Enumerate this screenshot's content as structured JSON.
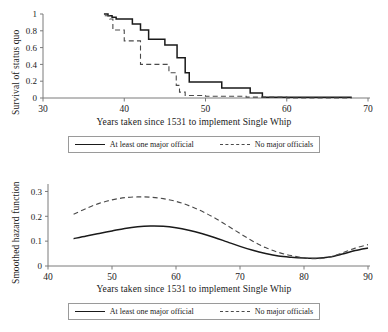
{
  "figure": {
    "panels": [
      {
        "id": "survival",
        "ylabel": "Survival of status quo",
        "xlabel": "Years taken since 1531 to implement Single Whip",
        "legend": {
          "solid_label": "At least one major official",
          "dashed_label": "No major officials"
        }
      },
      {
        "id": "hazard",
        "ylabel": "Smoothed hazard function",
        "xlabel": "Years taken since 1531 to implement Single Whip",
        "legend": {
          "solid_label": "At least one major official",
          "dashed_label": "No major officials"
        }
      }
    ]
  },
  "chart_data": [
    {
      "type": "line",
      "id": "survival-curve",
      "title": "",
      "subtitle": "",
      "xlabel": "Years taken since 1531 to implement Single Whip",
      "ylabel": "Survival of status quo",
      "xlim": [
        30,
        70
      ],
      "ylim": [
        0,
        1
      ],
      "xticks": [
        30,
        40,
        50,
        60,
        70
      ],
      "xticklabels": [
        "30",
        "40",
        "50",
        "60",
        "70"
      ],
      "yticks": [
        0,
        0.2,
        0.4,
        0.6,
        0.8,
        1
      ],
      "yticklabels": [
        "0",
        "0.2",
        "0.4",
        "0.6",
        "0.8",
        "1"
      ],
      "grid": false,
      "step": true,
      "legend_position": "below",
      "series": [
        {
          "name": "At least one major official",
          "style": "solid",
          "color": "#1a1a1a",
          "x": [
            37.5,
            38.0,
            38.5,
            39.0,
            40.0,
            41.0,
            41.5,
            42.0,
            43.0,
            44.5,
            45.0,
            46.0,
            46.5,
            47.0,
            47.5,
            48.0,
            49.0,
            51.0,
            52.0,
            54.0,
            55.5,
            56.0,
            57.0,
            60.0,
            65.0,
            68.0
          ],
          "y": [
            1.0,
            0.98,
            0.96,
            0.94,
            0.94,
            0.88,
            0.88,
            0.81,
            0.7,
            0.7,
            0.63,
            0.63,
            0.48,
            0.48,
            0.3,
            0.19,
            0.19,
            0.19,
            0.12,
            0.12,
            0.06,
            0.06,
            0.01,
            0.01,
            0.01,
            0.01
          ]
        },
        {
          "name": "No major officials",
          "style": "dashed",
          "color": "#4a4a4a",
          "x": [
            37.6,
            38.2,
            38.6,
            39.0,
            40.0,
            41.0,
            41.8,
            42.0,
            43.5,
            45.0,
            45.5,
            46.0,
            46.4,
            46.8,
            47.5,
            50.0,
            55.0,
            60.0,
            65.0,
            68.0
          ],
          "y": [
            0.98,
            0.94,
            0.81,
            0.81,
            0.68,
            0.68,
            0.68,
            0.4,
            0.4,
            0.4,
            0.3,
            0.3,
            0.15,
            0.07,
            0.03,
            0.02,
            0.01,
            0.0,
            0.0,
            0.0
          ]
        }
      ]
    },
    {
      "type": "line",
      "id": "hazard-curve",
      "title": "",
      "subtitle": "",
      "xlabel": "Years taken since 1531 to implement Single Whip",
      "ylabel": "Smoothed hazard function",
      "xlim": [
        40,
        90
      ],
      "ylim": [
        0,
        0.33
      ],
      "xticks": [
        40,
        50,
        60,
        70,
        80,
        90
      ],
      "xticklabels": [
        "40",
        "50",
        "60",
        "70",
        "80",
        "90"
      ],
      "yticks": [
        0,
        0.1,
        0.2,
        0.3
      ],
      "yticklabels": [
        "0",
        "0.1",
        "0.2",
        "0.3"
      ],
      "grid": false,
      "smooth": true,
      "legend_position": "below",
      "series": [
        {
          "name": "At least one major official",
          "style": "solid",
          "color": "#1a1a1a",
          "x": [
            44,
            46,
            48,
            50,
            52,
            54,
            56,
            58,
            60,
            62,
            64,
            66,
            68,
            70,
            72,
            74,
            76,
            78,
            80,
            82,
            84,
            86,
            88,
            90
          ],
          "y": [
            0.11,
            0.121,
            0.131,
            0.141,
            0.151,
            0.158,
            0.161,
            0.16,
            0.154,
            0.144,
            0.131,
            0.115,
            0.097,
            0.079,
            0.063,
            0.05,
            0.04,
            0.035,
            0.032,
            0.031,
            0.036,
            0.048,
            0.062,
            0.072
          ]
        },
        {
          "name": "No major officials",
          "style": "dashed",
          "color": "#4a4a4a",
          "x": [
            44,
            46,
            48,
            50,
            52,
            54,
            56,
            58,
            60,
            62,
            64,
            66,
            68,
            70,
            72,
            74,
            76,
            78,
            80,
            82,
            84,
            86,
            88,
            90
          ],
          "y": [
            0.208,
            0.232,
            0.252,
            0.266,
            0.275,
            0.278,
            0.277,
            0.271,
            0.26,
            0.243,
            0.221,
            0.194,
            0.163,
            0.131,
            0.1,
            0.074,
            0.055,
            0.042,
            0.033,
            0.029,
            0.036,
            0.053,
            0.072,
            0.086
          ]
        }
      ]
    }
  ]
}
